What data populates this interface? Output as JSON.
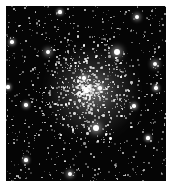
{
  "image": {
    "subject": "globular star cluster",
    "background_color": "#050505",
    "border_color": "#ffffff",
    "cluster_center": [
      86,
      90
    ],
    "core_glow_color": "#9a9a9a"
  },
  "bright_stars": [
    {
      "x": 117,
      "y": 52,
      "r": 3.2
    },
    {
      "x": 96,
      "y": 128,
      "r": 3.4
    },
    {
      "x": 48,
      "y": 52,
      "r": 2.4
    },
    {
      "x": 155,
      "y": 64,
      "r": 2.4
    },
    {
      "x": 137,
      "y": 17,
      "r": 2.0
    },
    {
      "x": 70,
      "y": 174,
      "r": 2.2
    },
    {
      "x": 12,
      "y": 42,
      "r": 1.8
    },
    {
      "x": 26,
      "y": 105,
      "r": 1.8
    },
    {
      "x": 156,
      "y": 88,
      "r": 1.8
    },
    {
      "x": 134,
      "y": 106,
      "r": 1.8
    },
    {
      "x": 8,
      "y": 87,
      "r": 1.6
    },
    {
      "x": 60,
      "y": 12,
      "r": 1.6
    },
    {
      "x": 26,
      "y": 160,
      "r": 1.6
    },
    {
      "x": 148,
      "y": 138,
      "r": 1.6
    },
    {
      "x": 100,
      "y": 88,
      "r": 1.8
    },
    {
      "x": 84,
      "y": 78,
      "r": 1.7
    }
  ]
}
